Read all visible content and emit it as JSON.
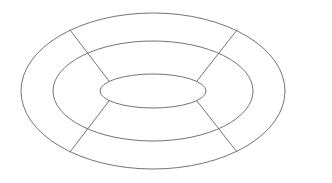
{
  "figure": {
    "background_color": "#ffffff",
    "stroke_color": "#636363",
    "stroke_width": 0.9,
    "canvas": {
      "width": 332,
      "height": 183
    }
  },
  "chart_data": {
    "type": "diagram",
    "title": "",
    "subtitle": "",
    "xlabel": "",
    "ylabel": "",
    "grid": false,
    "legend": "none",
    "annotations": [],
    "center": {
      "cx": 153,
      "cy": 91
    },
    "rings": [
      {
        "name": "outer-ellipse",
        "index": 0,
        "cx": 153,
        "cy": 91,
        "rx": 132,
        "ry": 78,
        "left": 21,
        "right": 285,
        "top": 13,
        "bottom": 169
      },
      {
        "name": "middle-ellipse",
        "index": 1,
        "cx": 153,
        "cy": 91,
        "rx": 100,
        "ry": 50,
        "left": 53,
        "right": 253,
        "top": 41,
        "bottom": 141
      },
      {
        "name": "inner-ellipse",
        "index": 2,
        "cx": 153,
        "cy": 91,
        "rx": 53,
        "ry": 17,
        "left": 100,
        "right": 206,
        "top": 74,
        "bottom": 108
      }
    ],
    "spokes": [
      {
        "name": "spoke-upper-left",
        "angle_deg": 145,
        "x1": 109,
        "y1": 81,
        "x2": 70,
        "y2": 30
      },
      {
        "name": "spoke-upper-right",
        "angle_deg": 35,
        "x1": 197,
        "y1": 81,
        "x2": 237,
        "y2": 30
      },
      {
        "name": "spoke-lower-left",
        "angle_deg": 215,
        "x1": 109,
        "y1": 101,
        "x2": 70,
        "y2": 152
      },
      {
        "name": "spoke-lower-right",
        "angle_deg": 325,
        "x1": 197,
        "y1": 101,
        "x2": 237,
        "y2": 152
      }
    ],
    "sector_count": 4,
    "band_count": 2
  }
}
